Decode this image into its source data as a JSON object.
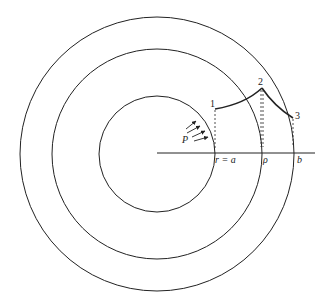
{
  "diagram": {
    "center": [
      157,
      154
    ],
    "circles": [
      {
        "name": "inner",
        "radius": 58
      },
      {
        "name": "middle",
        "radius": 105
      },
      {
        "name": "outer",
        "radius": 137
      }
    ],
    "axis": {
      "x1": 157,
      "x2": 315,
      "y": 153
    },
    "labels": {
      "point1": "1",
      "point2": "2",
      "point3": "3",
      "pressure": "P",
      "r_eq_a": "r = a",
      "rho": "ρ",
      "b": "b"
    },
    "points": {
      "p1": [
        215,
        109
      ],
      "p2": [
        262,
        88
      ],
      "p3": [
        293,
        118
      ]
    },
    "stroke_color": "#222222"
  }
}
